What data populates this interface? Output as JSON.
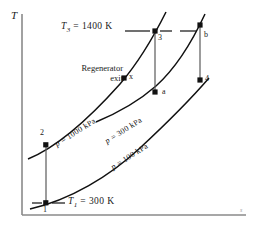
{
  "figure": {
    "type": "T-s diagram",
    "axes": {
      "y_label": "T",
      "x_label": "s"
    },
    "temperature_labels": [
      {
        "id": "T3",
        "text_html": "T3 = 1400 K",
        "symbol": "T",
        "sub": "3",
        "value": "1400 K",
        "x": 61,
        "y": 27
      },
      {
        "id": "T1",
        "text_html": "T1 = 300 K",
        "symbol": "T",
        "sub": "1",
        "value": "300 K",
        "x": 68,
        "y": 196
      }
    ],
    "annotation": {
      "line1": "Regenerator",
      "line2": "exit",
      "x": 60,
      "y": 68
    },
    "pressure_curves": [
      {
        "label_p": "p",
        "label_text": "= 1000 kPa",
        "full": "p = 1000 kPa",
        "value": 1000,
        "unit": "kPa",
        "x": 57,
        "y": 140,
        "rotate": -32
      },
      {
        "label_p": "p",
        "label_text": "= 300 kPa",
        "full": "p = 300 kPa",
        "value": 300,
        "unit": "kPa",
        "x": 107,
        "y": 137,
        "rotate": -32
      },
      {
        "label_p": "p",
        "label_text": "= 100 kPa",
        "full": "p = 100 kPa",
        "value": 100,
        "unit": "kPa",
        "x": 113,
        "y": 163,
        "rotate": -32
      }
    ],
    "states": [
      {
        "name": "1",
        "x": 46,
        "y": 203,
        "lx": 43,
        "ly": 206
      },
      {
        "name": "2",
        "x": 46,
        "y": 145,
        "lx": 40,
        "ly": 130
      },
      {
        "name": "x",
        "x": 124,
        "y": 78,
        "lx": 129,
        "ly": 74
      },
      {
        "name": "3",
        "x": 155,
        "y": 31,
        "lx": 158,
        "ly": 35
      },
      {
        "name": "a",
        "x": 155,
        "y": 92,
        "lx": 162,
        "ly": 89
      },
      {
        "name": "4",
        "x": 200,
        "y": 80,
        "lx": 205,
        "ly": 76
      },
      {
        "name": "b",
        "x": 200,
        "y": 25,
        "lx": 204,
        "ly": 32
      }
    ]
  }
}
